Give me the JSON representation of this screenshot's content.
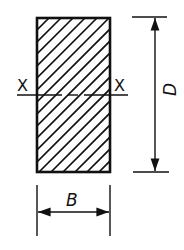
{
  "diagram": {
    "section": {
      "shape": "rectangle",
      "fill": "hatched",
      "hatch_angle_deg": 45,
      "stroke_color": "#111111"
    },
    "axis": {
      "name": "X-X",
      "left_label": "X",
      "right_label": "X",
      "style": "dashed centerline"
    },
    "dimensions": {
      "height": {
        "label": "D",
        "orientation": "vertical",
        "position": "right"
      },
      "width": {
        "label": "B",
        "orientation": "horizontal",
        "position": "bottom"
      }
    }
  }
}
